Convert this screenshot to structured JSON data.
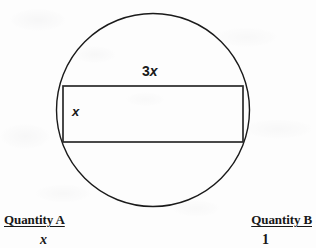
{
  "figure": {
    "name": "circle-with-inscribed-rectangle",
    "shapes": {
      "circle": {
        "name": "circle",
        "cx": 153,
        "cy": 110,
        "r": 96.5,
        "stroke": "#1a1a1a",
        "stroke_width": 1.4,
        "fill": "none"
      },
      "rectangle": {
        "name": "inscribed-rectangle",
        "x": 63,
        "y": 86,
        "width": 180,
        "height": 56,
        "stroke": "#2a2a2a",
        "stroke_width": 1.6,
        "fill": "none"
      }
    },
    "labels": {
      "width_label_prefix": "3",
      "width_label_variable": "x",
      "height_label": "x"
    }
  },
  "comparison": {
    "quantity_a": {
      "heading": "Quantity A",
      "value": "x"
    },
    "quantity_b": {
      "heading": "Quantity B",
      "value": "1"
    }
  },
  "colors": {
    "ink": "#1a1a1a",
    "paper": "#fdfdfd"
  }
}
